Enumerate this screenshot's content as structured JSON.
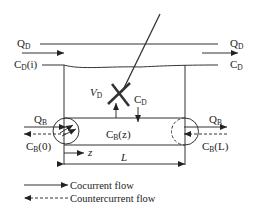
{
  "diagram": {
    "title": "",
    "labels": {
      "dialysate_flow_in": {
        "main": "Q",
        "sub": "D"
      },
      "dialysate_conc_in": {
        "main": "C",
        "sub": "D",
        "suffix": "(i)"
      },
      "dialysate_flow_out": {
        "main": "Q",
        "sub": "D"
      },
      "dialysate_conc_out": {
        "main": "C",
        "sub": "D"
      },
      "dialysate_volume": {
        "main": "V",
        "sub": "D"
      },
      "dialysate_conc_local": {
        "main": "C",
        "sub": "D"
      },
      "blood_flow_in": {
        "main": "Q",
        "sub": "B"
      },
      "blood_conc_in": {
        "main": "C",
        "sub": "B",
        "suffix": "(0)"
      },
      "blood_conc_local": {
        "main": "C",
        "sub": "B",
        "suffix": "(z)"
      },
      "blood_flow_out": {
        "main": "Q",
        "sub": "B"
      },
      "blood_conc_out": {
        "main": "C",
        "sub": "B",
        "suffix": "(L)"
      },
      "axial_position": "z",
      "length": "L"
    },
    "legend": [
      {
        "style": "solid-arrow",
        "label": "Cocurrent flow"
      },
      {
        "style": "dashed-arrow",
        "label": "Countercurrent flow"
      }
    ],
    "colors": {
      "line": "#333333",
      "text": "#222222",
      "background": "#ffffff"
    }
  }
}
